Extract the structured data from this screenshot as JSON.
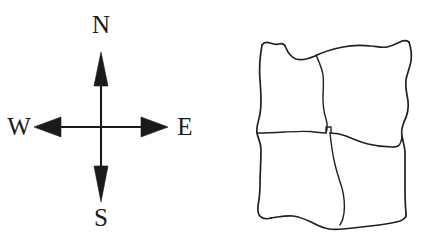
{
  "figure": {
    "background_color": "#ffffff",
    "ink_color": "#231f20",
    "panels": [
      {
        "name": "compass-rose",
        "type": "compass",
        "description": "Four-pointed compass rose with straight arrow shafts and solid triangular arrowheads",
        "center": {
          "x": 101,
          "y": 127
        },
        "labels": [
          {
            "id": "north",
            "text": "N",
            "position": "top"
          },
          {
            "id": "west",
            "text": "W",
            "position": "left"
          },
          {
            "id": "east",
            "text": "E",
            "position": "right"
          },
          {
            "id": "south",
            "text": "S",
            "position": "bottom"
          }
        ]
      },
      {
        "name": "hand-drawn-quadrilateral",
        "type": "sketch",
        "description": "Hand-drawn wobbly square outline subdivided by one wobbly horizontal line and two wobbly vertical lines into four irregular cells",
        "cell_count": 4,
        "cells": [
          "top-left",
          "top-right",
          "bottom-left",
          "bottom-right"
        ]
      }
    ]
  },
  "compass": {
    "north_label": "N",
    "west_label": "W",
    "east_label": "E",
    "south_label": "S",
    "arrow_color": "#1a1a1a"
  }
}
